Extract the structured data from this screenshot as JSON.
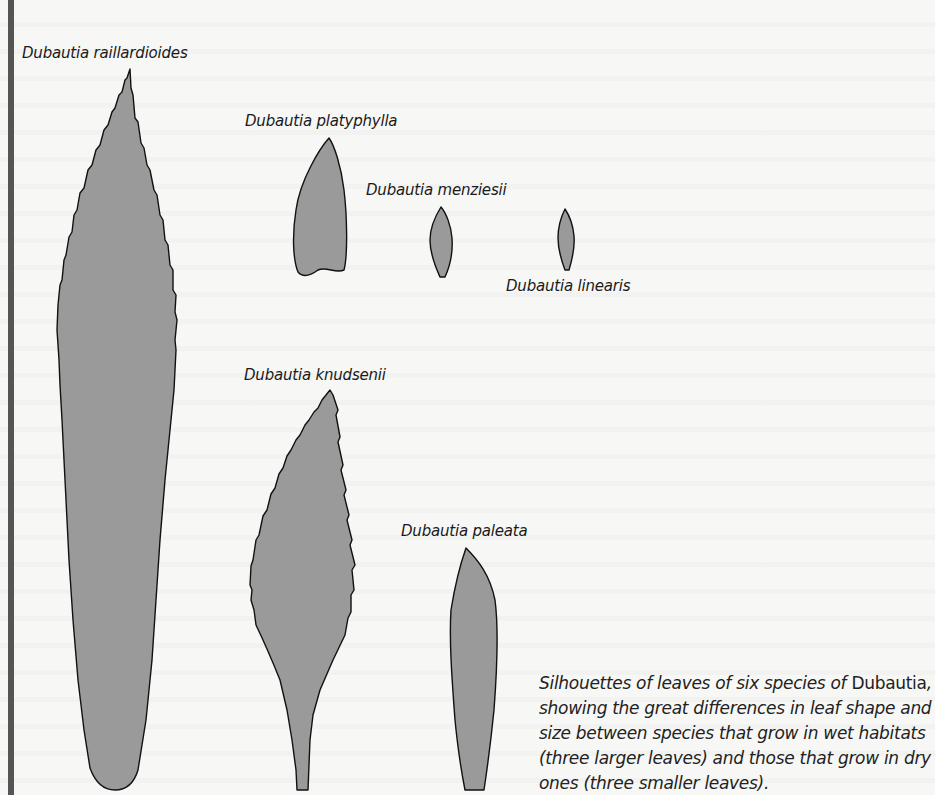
{
  "figure": {
    "leaves": [
      {
        "species": "Dubautia raillardioides",
        "habitat": "wet",
        "size": "larger"
      },
      {
        "species": "Dubautia platyphylla",
        "habitat": "wet",
        "size": "larger"
      },
      {
        "species": "Dubautia menziesii",
        "habitat": "dry",
        "size": "smaller"
      },
      {
        "species": "Dubautia linearis",
        "habitat": "dry",
        "size": "smaller"
      },
      {
        "species": "Dubautia knudsenii",
        "habitat": "wet",
        "size": "larger"
      },
      {
        "species": "Dubautia paleata",
        "habitat": "dry",
        "size": "smaller"
      }
    ],
    "caption": {
      "part1": "Silhouettes of leaves of six species of ",
      "genus": "Dubautia",
      "part2": ", showing the great differences in leaf shape and size between species that grow in wet habitats (three larger leaves) and those that grow in dry ones (three smaller leaves)."
    },
    "colors": {
      "leaf_fill": "#9a9a9a",
      "leaf_outline": "#111111",
      "side_bar": "#555555",
      "background": "#f7f7f5"
    }
  }
}
